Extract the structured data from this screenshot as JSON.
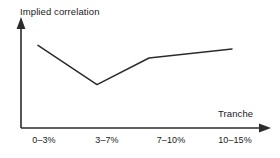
{
  "chart_data": {
    "type": "line",
    "title": "",
    "ylabel": "Implied correlation",
    "xlabel": "Tranche",
    "categories": [
      "0–3%",
      "3–7%",
      "7–10%",
      "10–15%"
    ],
    "series": [
      {
        "name": "Implied correlation",
        "values": [
          78,
          22,
          60,
          73
        ]
      }
    ],
    "ylim": [
      0,
      100
    ],
    "grid": false,
    "legend": false,
    "annotations": [],
    "line_color": "#2b2b2b",
    "axis_color": "#2b2b2b",
    "background_color": "#ffffff"
  },
  "axes": {
    "y_arrow": "up-arrow-icon",
    "x_arrow": "right-arrow-icon"
  }
}
